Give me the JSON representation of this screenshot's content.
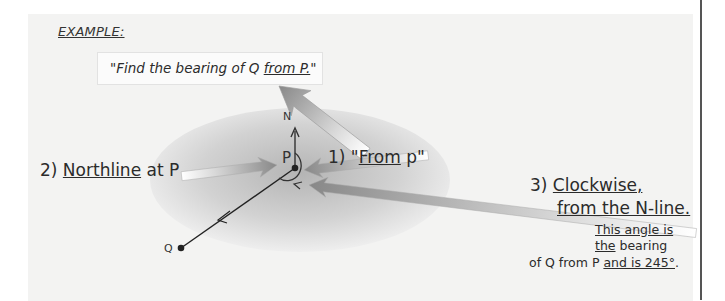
{
  "heading": "EXAMPLE:",
  "question": {
    "prefix": "\"Find the bearing of Q ",
    "underlined": "from P.",
    "suffix": "\""
  },
  "points": {
    "north_label": "N",
    "p_label": "P",
    "q_label": "Q"
  },
  "steps": [
    {
      "number": "1)",
      "pre": "\"",
      "underlined": "From",
      "post": " p\""
    },
    {
      "number": "2)",
      "underlined": "Northline",
      "post": " at P"
    },
    {
      "number": "3)",
      "line1_underlined": "Clockwise,",
      "line2_underlined": "from the N-line."
    }
  ],
  "note": {
    "line1_underlined": "This angle is",
    "line2_underlined": "the",
    "line2_rest": " bearing",
    "line3_plain": "of Q from P ",
    "line3_underlined": "and is 245°",
    "line3_end": "."
  },
  "bearing_degrees": 245,
  "colors": {
    "panel_bg": "#f3f3f2",
    "ellipse_center": "#bdbdbd",
    "arrow_dark": "#8a8a8a",
    "arrow_light": "#ffffff",
    "ink": "#222222"
  }
}
